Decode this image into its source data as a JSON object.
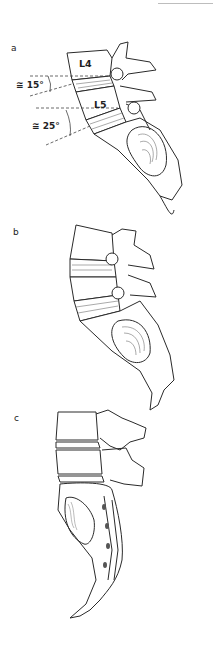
{
  "figure": {
    "panels": [
      {
        "label": "a",
        "vertebra_labels": [
          "L4",
          "L5"
        ],
        "angles": [
          {
            "symbol": "≅",
            "value": "15°",
            "text": "≅ 15°"
          },
          {
            "symbol": "≅",
            "value": "25°",
            "text": "≅ 25°"
          }
        ]
      },
      {
        "label": "b"
      },
      {
        "label": "c"
      }
    ]
  },
  "colors": {
    "line": "#2a2a2a",
    "hatch": "#555555",
    "dash": "#444444",
    "background": "#ffffff"
  }
}
